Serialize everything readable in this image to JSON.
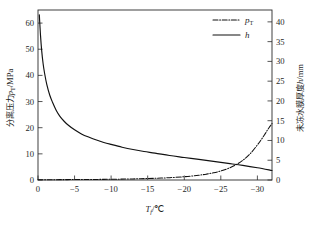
{
  "chart_data": {
    "type": "line",
    "title": "",
    "xlabel": "T_f/℃",
    "xlabel_symbol": "T",
    "xlabel_sub": "f",
    "xlabel_unit": "/℃",
    "ylabel_left_cn": "分离压力",
    "ylabel_left_symbol": "p",
    "ylabel_left_sub": "T",
    "ylabel_left_unit": "/MPa",
    "ylabel_right_cn": "未冻水膜厚度",
    "ylabel_right_symbol": "h",
    "ylabel_right_unit": "/mm",
    "x_ticks": [
      0,
      -5,
      -10,
      -15,
      -20,
      -25,
      -30
    ],
    "x_tick_labels": [
      "0",
      "−5",
      "−10",
      "−15",
      "−20",
      "−25",
      "−30"
    ],
    "xlim": [
      0,
      -32
    ],
    "y_left_ticks": [
      0,
      10,
      20,
      30,
      40,
      50,
      60
    ],
    "y_left_tick_labels": [
      "0",
      "10",
      "20",
      "30",
      "40",
      "50",
      "60"
    ],
    "ylim_left": [
      0,
      65
    ],
    "y_right_ticks": [
      0,
      5,
      10,
      15,
      20,
      25,
      30,
      35,
      40
    ],
    "y_right_tick_labels": [
      "0",
      "5",
      "10",
      "15",
      "20",
      "25",
      "30",
      "35",
      "40"
    ],
    "ylim_right": [
      0,
      43
    ],
    "grid": false,
    "legend_position": "top-right",
    "series": [
      {
        "name": "p_T",
        "legend_label": "p",
        "legend_sub": "T",
        "axis": "left",
        "style": "dash-dot",
        "color": "#111111",
        "x": [
          0,
          -2,
          -4,
          -6,
          -8,
          -10,
          -12,
          -14,
          -16,
          -18,
          -20,
          -21,
          -22,
          -23,
          -24,
          -25,
          -26,
          -27,
          -28,
          -29,
          -30,
          -30.5,
          -31,
          -31.4,
          -31.7,
          -32
        ],
        "values": [
          0.12,
          0.13,
          0.15,
          0.18,
          0.22,
          0.28,
          0.36,
          0.48,
          0.64,
          0.88,
          1.25,
          1.5,
          1.82,
          2.22,
          2.75,
          3.45,
          4.4,
          5.7,
          7.5,
          10.0,
          13.4,
          15.3,
          17.4,
          19.2,
          20.4,
          21.6
        ]
      },
      {
        "name": "h",
        "legend_label": "h",
        "axis": "right",
        "style": "solid",
        "color": "#111111",
        "x": [
          -0.18,
          -0.25,
          -0.35,
          -0.5,
          -0.7,
          -0.9,
          -1.2,
          -1.6,
          -2.0,
          -2.5,
          -3.0,
          -3.6,
          -4.2,
          -5.0,
          -6.0,
          -7.0,
          -8.0,
          -9.0,
          -10.0,
          -11.5,
          -13.0,
          -14.5,
          -16.0,
          -18.0,
          -20.0,
          -22.0,
          -24.0,
          -26.0,
          -28.0,
          -30.0,
          -32.0
        ],
        "values": [
          41.8,
          39.5,
          36.4,
          32.8,
          29.4,
          27.0,
          24.2,
          21.5,
          19.6,
          17.6,
          16.1,
          14.8,
          13.8,
          12.7,
          11.6,
          10.8,
          10.1,
          9.5,
          9.0,
          8.3,
          7.7,
          7.2,
          6.8,
          6.2,
          5.7,
          5.2,
          4.7,
          4.2,
          3.7,
          3.1,
          2.4
        ]
      }
    ]
  },
  "axis_geometry": {
    "plot_left": 38,
    "plot_right": 272,
    "plot_top": 10,
    "plot_bottom": 180
  }
}
